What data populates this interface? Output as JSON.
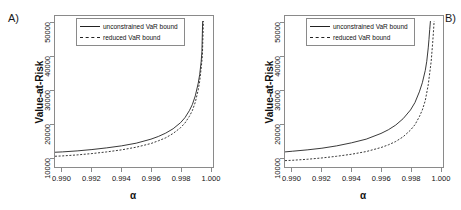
{
  "figure": {
    "panels": [
      {
        "tag": "A)",
        "xlabel": "α",
        "ylabel": "Value-at-Risk",
        "legend": [
          {
            "label": "unconstrained VaR bound",
            "style": "solid"
          },
          {
            "label": "reduced VaR bound",
            "style": "dashed"
          }
        ],
        "xticks": [
          "0.990",
          "0.992",
          "0.994",
          "0.996",
          "0.998",
          "1.000"
        ],
        "yticks": [
          "10000",
          "20000",
          "30000",
          "40000",
          "50000"
        ]
      },
      {
        "tag": "B)",
        "xlabel": "α",
        "ylabel": "Value-at-Risk",
        "legend": [
          {
            "label": "unconstrained VaR bound",
            "style": "solid"
          },
          {
            "label": "reduced VaR bound",
            "style": "dashed"
          }
        ],
        "xticks": [
          "0.990",
          "0.992",
          "0.994",
          "0.996",
          "0.998",
          "1.000"
        ],
        "yticks": [
          "10000",
          "20000",
          "30000",
          "40000",
          "50000"
        ]
      }
    ]
  },
  "chart_data": [
    {
      "type": "line",
      "title": "A)",
      "xlabel": "α",
      "ylabel": "Value-at-Risk",
      "xlim": [
        0.9895,
        1.0002
      ],
      "ylim": [
        7000,
        52000
      ],
      "xticks": [
        0.99,
        0.992,
        0.994,
        0.996,
        0.998,
        1.0
      ],
      "yticks": [
        10000,
        20000,
        30000,
        40000,
        50000
      ],
      "grid": false,
      "legend_position": "top-right",
      "series": [
        {
          "name": "unconstrained VaR bound",
          "style": "solid",
          "x": [
            0.9895,
            0.99,
            0.991,
            0.992,
            0.993,
            0.994,
            0.995,
            0.996,
            0.9965,
            0.997,
            0.9975,
            0.998,
            0.9983,
            0.9986,
            0.9988,
            0.999,
            0.9992,
            0.9993,
            0.9994,
            0.99945,
            0.9995
          ],
          "y": [
            11400,
            11500,
            11800,
            12200,
            12700,
            13300,
            14100,
            15300,
            16100,
            17100,
            18400,
            20200,
            21700,
            23800,
            25600,
            28200,
            32000,
            34600,
            38500,
            41500,
            50500
          ]
        },
        {
          "name": "reduced VaR bound",
          "style": "dashed",
          "x": [
            0.9895,
            0.99,
            0.991,
            0.992,
            0.993,
            0.994,
            0.995,
            0.996,
            0.9965,
            0.997,
            0.9975,
            0.998,
            0.9983,
            0.9986,
            0.9988,
            0.999,
            0.9992,
            0.9993,
            0.9994,
            0.99948,
            0.99955
          ],
          "y": [
            10200,
            10300,
            10600,
            11000,
            11500,
            12100,
            12900,
            14000,
            14800,
            15700,
            17000,
            18700,
            20100,
            22100,
            23800,
            26300,
            30000,
            32600,
            36500,
            40000,
            50500
          ]
        }
      ]
    },
    {
      "type": "line",
      "title": "B)",
      "xlabel": "α",
      "ylabel": "Value-at-Risk",
      "xlim": [
        0.9895,
        1.0002
      ],
      "ylim": [
        7000,
        52000
      ],
      "xticks": [
        0.99,
        0.992,
        0.994,
        0.996,
        0.998,
        1.0
      ],
      "yticks": [
        10000,
        20000,
        30000,
        40000,
        50000
      ],
      "grid": false,
      "legend_position": "top-right",
      "series": [
        {
          "name": "unconstrained VaR bound",
          "style": "solid",
          "x": [
            0.9895,
            0.99,
            0.991,
            0.992,
            0.993,
            0.994,
            0.995,
            0.996,
            0.9965,
            0.997,
            0.9975,
            0.998,
            0.9983,
            0.9986,
            0.9988,
            0.999,
            0.9991,
            0.9992,
            0.99925,
            0.9993,
            0.99935
          ],
          "y": [
            11500,
            11700,
            12100,
            12600,
            13300,
            14200,
            15300,
            17000,
            18100,
            19500,
            21400,
            24000,
            26200,
            29400,
            32100,
            35800,
            38500,
            42500,
            45000,
            48000,
            50500
          ]
        },
        {
          "name": "reduced VaR bound",
          "style": "dashed",
          "x": [
            0.9895,
            0.99,
            0.991,
            0.992,
            0.993,
            0.994,
            0.995,
            0.996,
            0.9965,
            0.997,
            0.9975,
            0.998,
            0.9983,
            0.9986,
            0.9988,
            0.999,
            0.9992,
            0.9994,
            0.9995,
            0.99955,
            0.9996
          ],
          "y": [
            8900,
            9000,
            9300,
            9700,
            10200,
            10800,
            11600,
            12800,
            13600,
            14600,
            16000,
            18000,
            19600,
            22000,
            24000,
            26800,
            31500,
            38500,
            44000,
            47000,
            50500
          ]
        }
      ]
    }
  ]
}
